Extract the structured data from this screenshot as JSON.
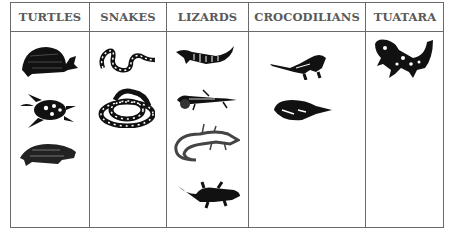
{
  "table": {
    "columns": [
      {
        "header": "TURTLES",
        "animals": [
          "box-turtle",
          "sea-turtle",
          "snapping-turtle"
        ]
      },
      {
        "header": "SNAKES",
        "animals": [
          "spotted-snake",
          "coiled-rattlesnake"
        ]
      },
      {
        "header": "LIZARDS",
        "animals": [
          "banded-lizard",
          "whiptail-lizard",
          "speckled-lizard",
          "gecko"
        ]
      },
      {
        "header": "CROCODILIANS",
        "animals": [
          "crocodile",
          "alligator"
        ]
      },
      {
        "header": "TUATARA",
        "animals": [
          "tuatara"
        ]
      }
    ]
  },
  "colors": {
    "border": "#6a6a6a",
    "header_text": "#5a5a5a",
    "ink": "#111111"
  }
}
